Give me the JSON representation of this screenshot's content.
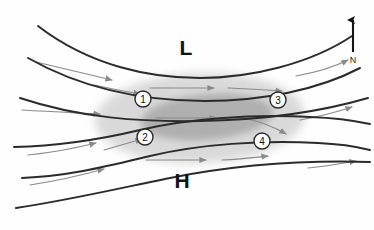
{
  "figure": {
    "background_color": "#fefefe",
    "width": 374,
    "height": 230
  },
  "pressure_systems": [
    {
      "label": "L",
      "name": "low-pressure-center",
      "x": 186,
      "y": 55
    },
    {
      "label": "H",
      "name": "high-pressure-center",
      "x": 182,
      "y": 188
    }
  ],
  "compass": {
    "label": "N",
    "direction": "up",
    "arrow_x": 353,
    "arrow_top_y": 20,
    "arrow_bottom_y": 52,
    "label_x": 353,
    "label_y": 63
  },
  "markers": [
    {
      "id": "1",
      "x": 143,
      "y": 99
    },
    {
      "id": "2",
      "x": 145,
      "y": 137
    },
    {
      "id": "3",
      "x": 278,
      "y": 100
    },
    {
      "id": "4",
      "x": 262,
      "y": 141
    }
  ],
  "regions": [
    {
      "name": "jet-streak-outer",
      "fill": "#d3d3d3",
      "opacity": 0.85,
      "cx": 200,
      "cy": 118,
      "rx": 105,
      "ry": 45,
      "rotation": -2
    },
    {
      "name": "jet-core-inner",
      "fill": "#a8a8a8",
      "opacity": 0.85,
      "cx": 207,
      "cy": 117,
      "rx": 66,
      "ry": 23,
      "rotation": -5
    }
  ],
  "streamlines": {
    "stroke": "#2b2b2b",
    "stroke_width": 2.0,
    "paths": [
      "M 38,26 C 90,66 150,78 200,78 C 250,78 310,64 352,36",
      "M 28,58 C 88,92 150,101 205,101 C 262,101 318,90 360,68",
      "M 20,98 C 80,118 140,122 200,121 C 262,120 320,112 368,98",
      "M 14,147 C 60,146 98,140 140,130 C 186,119 250,114 310,117 C 338,118 356,121 370,124",
      "M 22,178 C 70,176 108,166 150,156 C 200,144 262,140 318,143 C 342,144 358,147 370,150",
      "M 16,208 C 70,200 120,188 170,178 C 230,166 300,160 370,162"
    ]
  },
  "flow_arrows": {
    "stroke": "#8a8a8a",
    "stroke_width": 1.2,
    "items": [
      {
        "path": "M 36,62 C 70,70 96,76 112,80",
        "name": "flow-arrow-upper-left-1"
      },
      {
        "path": "M 22,110 C 56,112 82,113 100,114",
        "name": "flow-arrow-left-mid"
      },
      {
        "path": "M 28,155 C 58,152 80,147 96,143",
        "name": "flow-arrow-lower-left"
      },
      {
        "path": "M 30,185 C 62,180 86,174 104,169",
        "name": "flow-arrow-bottom-left"
      },
      {
        "path": "M 94,85 C 112,89 128,92 140,94",
        "name": "flow-arrow-into-marker-1"
      },
      {
        "path": "M 104,150 C 118,146 132,142 142,139",
        "name": "flow-arrow-into-marker-2"
      },
      {
        "path": "M 150,88 C 176,88 198,88 214,88",
        "name": "flow-arrow-core-north"
      },
      {
        "path": "M 228,88 C 250,89 268,90 282,91",
        "name": "flow-arrow-core-north-exit"
      },
      {
        "path": "M 156,118 C 180,118 200,118 216,118",
        "name": "flow-arrow-core-center"
      },
      {
        "path": "M 146,160 C 170,160 190,160 206,160",
        "name": "flow-arrow-core-south"
      },
      {
        "path": "M 222,160 C 244,159 258,157 268,156",
        "name": "flow-arrow-core-south-exit"
      },
      {
        "path": "M 244,118 C 262,122 276,128 286,134",
        "name": "flow-arrow-core-exit-se"
      },
      {
        "path": "M 296,76 C 318,72 336,66 348,60",
        "name": "flow-arrow-upper-right"
      },
      {
        "path": "M 300,120 C 322,116 340,111 352,107",
        "name": "flow-arrow-right-mid"
      },
      {
        "path": "M 308,168 C 328,166 344,163 356,161",
        "name": "flow-arrow-lower-right"
      }
    ]
  }
}
